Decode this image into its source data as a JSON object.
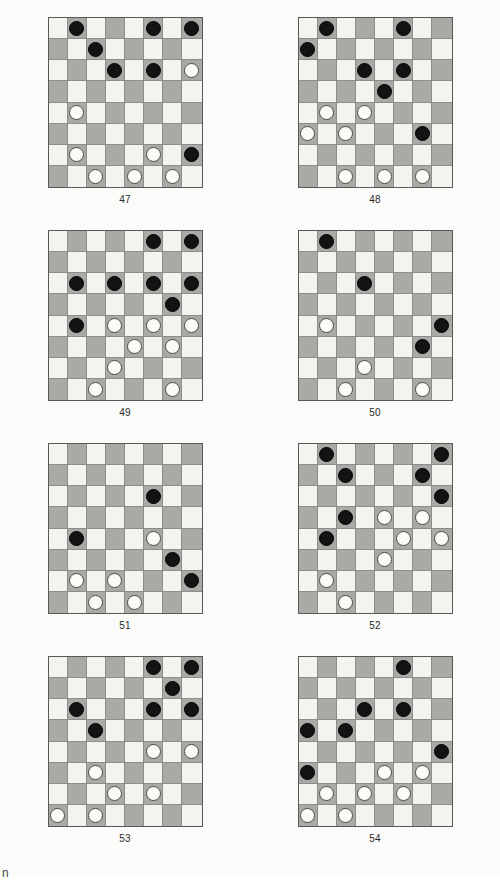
{
  "page": {
    "background_color": "#fbfbf9",
    "corner_mark": "n",
    "board_size": 8,
    "colors": {
      "light_square": "#f4f3ef",
      "dark_square": "#a9a9a5",
      "black_piece": "#131313",
      "white_piece": "#fbfbf7",
      "board_border": "#585858",
      "grid_line": "#8d8d8d",
      "caption_text": "#2b2b2b"
    },
    "legend": {
      "black_piece_label": "black checker",
      "white_piece_label": "white checker",
      "dark_square_pattern": "(row + col) is odd"
    }
  },
  "diagrams": [
    {
      "caption": "47",
      "black_count": 8,
      "white_count": 7,
      "pieces": [
        {
          "row": 0,
          "col": 1,
          "color": "black"
        },
        {
          "row": 0,
          "col": 5,
          "color": "black"
        },
        {
          "row": 0,
          "col": 7,
          "color": "black"
        },
        {
          "row": 1,
          "col": 2,
          "color": "black"
        },
        {
          "row": 2,
          "col": 3,
          "color": "black"
        },
        {
          "row": 2,
          "col": 5,
          "color": "black"
        },
        {
          "row": 2,
          "col": 7,
          "color": "white"
        },
        {
          "row": 4,
          "col": 1,
          "color": "white"
        },
        {
          "row": 6,
          "col": 1,
          "color": "white"
        },
        {
          "row": 6,
          "col": 5,
          "color": "white"
        },
        {
          "row": 6,
          "col": 7,
          "color": "black"
        },
        {
          "row": 7,
          "col": 2,
          "color": "white"
        },
        {
          "row": 7,
          "col": 4,
          "color": "white"
        },
        {
          "row": 7,
          "col": 6,
          "color": "white"
        }
      ]
    },
    {
      "caption": "48",
      "black_count": 7,
      "white_count": 7,
      "pieces": [
        {
          "row": 0,
          "col": 1,
          "color": "black"
        },
        {
          "row": 0,
          "col": 5,
          "color": "black"
        },
        {
          "row": 1,
          "col": 0,
          "color": "black"
        },
        {
          "row": 2,
          "col": 3,
          "color": "black"
        },
        {
          "row": 2,
          "col": 5,
          "color": "black"
        },
        {
          "row": 3,
          "col": 4,
          "color": "black"
        },
        {
          "row": 4,
          "col": 1,
          "color": "white"
        },
        {
          "row": 4,
          "col": 3,
          "color": "white"
        },
        {
          "row": 5,
          "col": 0,
          "color": "white"
        },
        {
          "row": 5,
          "col": 2,
          "color": "white"
        },
        {
          "row": 5,
          "col": 6,
          "color": "black"
        },
        {
          "row": 7,
          "col": 2,
          "color": "white"
        },
        {
          "row": 7,
          "col": 4,
          "color": "white"
        },
        {
          "row": 7,
          "col": 6,
          "color": "white"
        }
      ]
    },
    {
      "caption": "49",
      "black_count": 8,
      "white_count": 8,
      "pieces": [
        {
          "row": 0,
          "col": 5,
          "color": "black"
        },
        {
          "row": 0,
          "col": 7,
          "color": "black"
        },
        {
          "row": 2,
          "col": 1,
          "color": "black"
        },
        {
          "row": 2,
          "col": 3,
          "color": "black"
        },
        {
          "row": 2,
          "col": 5,
          "color": "black"
        },
        {
          "row": 2,
          "col": 7,
          "color": "black"
        },
        {
          "row": 3,
          "col": 6,
          "color": "black"
        },
        {
          "row": 4,
          "col": 1,
          "color": "black"
        },
        {
          "row": 4,
          "col": 3,
          "color": "white"
        },
        {
          "row": 4,
          "col": 5,
          "color": "white"
        },
        {
          "row": 4,
          "col": 7,
          "color": "white"
        },
        {
          "row": 5,
          "col": 4,
          "color": "white"
        },
        {
          "row": 5,
          "col": 6,
          "color": "white"
        },
        {
          "row": 6,
          "col": 3,
          "color": "white"
        },
        {
          "row": 7,
          "col": 2,
          "color": "white"
        },
        {
          "row": 7,
          "col": 6,
          "color": "white"
        }
      ]
    },
    {
      "caption": "50",
      "black_count": 4,
      "white_count": 4,
      "pieces": [
        {
          "row": 0,
          "col": 1,
          "color": "black"
        },
        {
          "row": 2,
          "col": 3,
          "color": "black"
        },
        {
          "row": 4,
          "col": 1,
          "color": "white"
        },
        {
          "row": 4,
          "col": 7,
          "color": "black"
        },
        {
          "row": 5,
          "col": 6,
          "color": "black"
        },
        {
          "row": 6,
          "col": 3,
          "color": "white"
        },
        {
          "row": 7,
          "col": 2,
          "color": "white"
        },
        {
          "row": 7,
          "col": 6,
          "color": "white"
        }
      ]
    },
    {
      "caption": "51",
      "black_count": 4,
      "white_count": 5,
      "pieces": [
        {
          "row": 2,
          "col": 5,
          "color": "black"
        },
        {
          "row": 4,
          "col": 1,
          "color": "black"
        },
        {
          "row": 4,
          "col": 5,
          "color": "white"
        },
        {
          "row": 5,
          "col": 6,
          "color": "black"
        },
        {
          "row": 6,
          "col": 1,
          "color": "white"
        },
        {
          "row": 6,
          "col": 3,
          "color": "white"
        },
        {
          "row": 6,
          "col": 7,
          "color": "black"
        },
        {
          "row": 7,
          "col": 2,
          "color": "white"
        },
        {
          "row": 7,
          "col": 4,
          "color": "white"
        }
      ]
    },
    {
      "caption": "52",
      "black_count": 8,
      "white_count": 7,
      "pieces": [
        {
          "row": 0,
          "col": 1,
          "color": "black"
        },
        {
          "row": 0,
          "col": 7,
          "color": "black"
        },
        {
          "row": 1,
          "col": 2,
          "color": "black"
        },
        {
          "row": 1,
          "col": 6,
          "color": "black"
        },
        {
          "row": 2,
          "col": 7,
          "color": "black"
        },
        {
          "row": 3,
          "col": 2,
          "color": "black"
        },
        {
          "row": 3,
          "col": 4,
          "color": "white"
        },
        {
          "row": 3,
          "col": 6,
          "color": "white"
        },
        {
          "row": 4,
          "col": 1,
          "color": "black"
        },
        {
          "row": 4,
          "col": 5,
          "color": "white"
        },
        {
          "row": 4,
          "col": 7,
          "color": "white"
        },
        {
          "row": 5,
          "col": 4,
          "color": "white"
        },
        {
          "row": 6,
          "col": 1,
          "color": "white"
        },
        {
          "row": 7,
          "col": 2,
          "color": "white"
        }
      ]
    },
    {
      "caption": "53",
      "black_count": 7,
      "white_count": 7,
      "pieces": [
        {
          "row": 0,
          "col": 5,
          "color": "black"
        },
        {
          "row": 0,
          "col": 7,
          "color": "black"
        },
        {
          "row": 1,
          "col": 6,
          "color": "black"
        },
        {
          "row": 2,
          "col": 1,
          "color": "black"
        },
        {
          "row": 2,
          "col": 5,
          "color": "black"
        },
        {
          "row": 2,
          "col": 7,
          "color": "black"
        },
        {
          "row": 3,
          "col": 2,
          "color": "black"
        },
        {
          "row": 4,
          "col": 5,
          "color": "white"
        },
        {
          "row": 4,
          "col": 7,
          "color": "white"
        },
        {
          "row": 5,
          "col": 2,
          "color": "white"
        },
        {
          "row": 6,
          "col": 3,
          "color": "white"
        },
        {
          "row": 6,
          "col": 5,
          "color": "white"
        },
        {
          "row": 7,
          "col": 0,
          "color": "white"
        },
        {
          "row": 7,
          "col": 2,
          "color": "white"
        }
      ]
    },
    {
      "caption": "54",
      "black_count": 7,
      "white_count": 7,
      "pieces": [
        {
          "row": 0,
          "col": 5,
          "color": "black"
        },
        {
          "row": 2,
          "col": 3,
          "color": "black"
        },
        {
          "row": 2,
          "col": 5,
          "color": "black"
        },
        {
          "row": 3,
          "col": 0,
          "color": "black"
        },
        {
          "row": 3,
          "col": 2,
          "color": "black"
        },
        {
          "row": 4,
          "col": 7,
          "color": "black"
        },
        {
          "row": 5,
          "col": 0,
          "color": "black"
        },
        {
          "row": 5,
          "col": 4,
          "color": "white"
        },
        {
          "row": 5,
          "col": 6,
          "color": "white"
        },
        {
          "row": 6,
          "col": 1,
          "color": "white"
        },
        {
          "row": 6,
          "col": 3,
          "color": "white"
        },
        {
          "row": 6,
          "col": 5,
          "color": "white"
        },
        {
          "row": 7,
          "col": 0,
          "color": "white"
        },
        {
          "row": 7,
          "col": 2,
          "color": "white"
        }
      ]
    }
  ]
}
